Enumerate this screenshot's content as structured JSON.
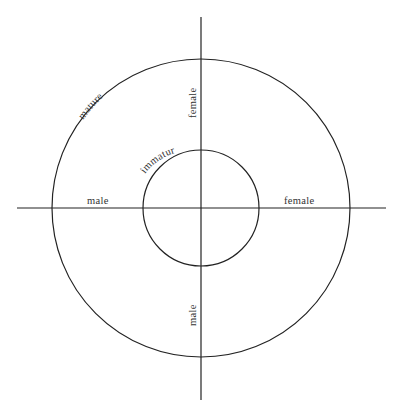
{
  "diagram": {
    "center": [
      201,
      208
    ],
    "axes": {
      "vertical": {
        "x": 201,
        "y1": 17,
        "y2": 400
      },
      "horizontal": {
        "y": 208,
        "x1": 17,
        "x2": 386
      }
    },
    "circles": {
      "outer": {
        "r": 149,
        "label": "mature"
      },
      "inner": {
        "r": 58,
        "label": "immature"
      }
    },
    "labels": {
      "outer_circle": "mature",
      "inner_circle": "immature",
      "top_axis": "female",
      "bottom_axis": "male",
      "left_axis": "male",
      "right_axis": "female"
    },
    "colors": {
      "line": "#222222",
      "text": "#333333",
      "background": "#ffffff"
    }
  }
}
